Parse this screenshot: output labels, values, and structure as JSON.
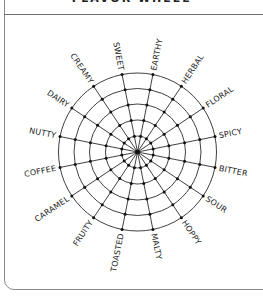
{
  "header": {
    "title": "FLAVOR WHEEL"
  },
  "wheel": {
    "center": [
      137.5,
      152
    ],
    "ring_radii": [
      16,
      32,
      48,
      63.5,
      79
    ],
    "start_angle_deg": -78.75,
    "step_deg": 22.5,
    "line_color": "#2a2a2a",
    "dot_color": "#111111",
    "labels": [
      "EARTHY",
      "HERBAL",
      "FLORAL",
      "SPICY",
      "BITTER",
      "SOUR",
      "HOPPY",
      "MALTY",
      "TOASTED",
      "FRUITY",
      "CARAMEL",
      "COFFEE",
      "NUTTY",
      "DAIRY",
      "CREAMY",
      "SWEET"
    ]
  }
}
